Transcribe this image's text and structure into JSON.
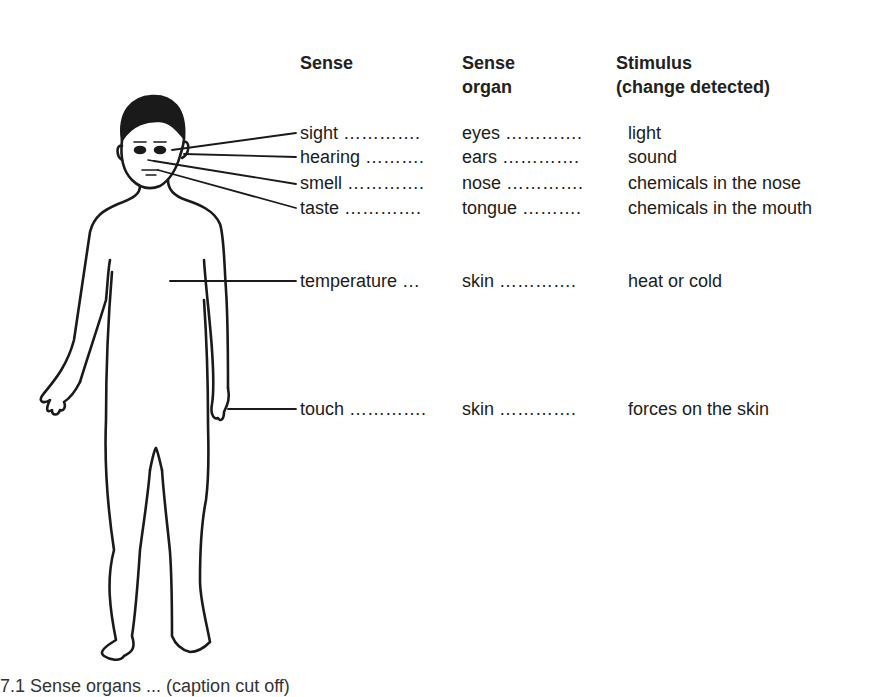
{
  "headers": {
    "sense": "Sense",
    "organ_line1": "Sense",
    "organ_line2": "organ",
    "stimulus_line1": "Stimulus",
    "stimulus_line2": "(change detected)"
  },
  "rows": [
    {
      "sense": "sight ………….",
      "organ": "eyes ………….",
      "stimulus": "light"
    },
    {
      "sense": "hearing ……….",
      "organ": "ears ………….",
      "stimulus": "sound"
    },
    {
      "sense": "smell ………….",
      "organ": "nose ………….",
      "stimulus": "chemicals in the nose"
    },
    {
      "sense": "taste ………….",
      "organ": "tongue ……….",
      "stimulus": "chemicals in the mouth"
    },
    {
      "sense": "temperature …",
      "organ": "skin ………….",
      "stimulus": "heat or cold"
    },
    {
      "sense": "touch ………….",
      "organ": "skin ………….",
      "stimulus": "forces on the skin"
    }
  ],
  "caption": "7.1 Sense organs ... (caption cut off)",
  "colors": {
    "ink": "#1a1a1a",
    "background": "#ffffff"
  }
}
